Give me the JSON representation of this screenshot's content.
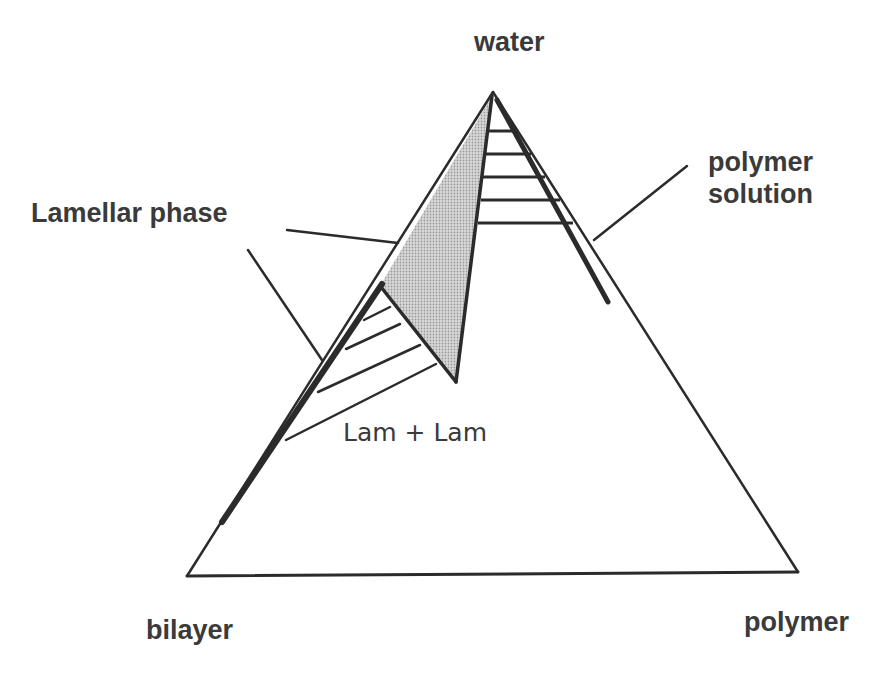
{
  "diagram": {
    "type": "ternary-phase-diagram",
    "vertices": {
      "top": "water",
      "bottom_left": "bilayer",
      "bottom_right": "polymer"
    },
    "labels": {
      "water": "water",
      "bilayer": "bilayer",
      "polymer": "polymer",
      "lamellar_phase": "Lamellar phase",
      "polymer_solution_line1": "polymer",
      "polymer_solution_line2": "solution",
      "lam_lam": "Lam + Lam"
    },
    "regions": [
      {
        "name": "Lamellar phase",
        "style": "shaded"
      },
      {
        "name": "Lam + Lam",
        "style": "tie-lines",
        "tie_line_count": 4
      },
      {
        "name": "Lamellar + polymer solution",
        "style": "tie-lines",
        "tie_line_count": 5
      },
      {
        "name": "polymer solution",
        "style": "thick-line"
      }
    ],
    "colors": {
      "line": "#2b2b2b",
      "shade": "#c8c8c8",
      "text": "#3a3a3a"
    }
  }
}
